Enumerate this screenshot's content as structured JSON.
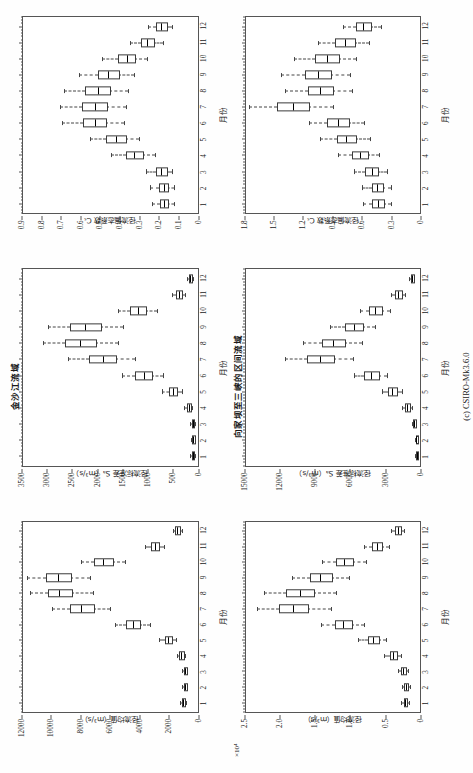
{
  "figure": {
    "caption": "(c) CSIRO-Mk3.6.0"
  },
  "panels": [
    {
      "id": "jinshajiang-runoff",
      "row_title": "",
      "y_title": "径流均值（m³/s）",
      "x_title": "月份",
      "y_multiplier": ""
    },
    {
      "id": "jinshajiang-std",
      "row_title": "金沙江流域",
      "y_title": "径流标准差 Sₐ（m³/s）",
      "x_title": "月份",
      "y_multiplier": ""
    },
    {
      "id": "jinshajiang-cv",
      "row_title": "",
      "y_title": "径流偏态系数 Cₛ",
      "x_title": "月份",
      "y_multiplier": ""
    },
    {
      "id": "xiangjiaba-runoff",
      "row_title": "",
      "y_title": "径流均值（m³/s）",
      "x_title": "月份",
      "y_multiplier": "×10⁴"
    },
    {
      "id": "xiangjiaba-std",
      "row_title": "向家坝至三峡的区间流域",
      "y_title": "径流标准差 Sₐ（m³/s）",
      "x_title": "月份",
      "y_multiplier": ""
    },
    {
      "id": "xiangjiaba-cv",
      "row_title": "",
      "y_title": "径流偏态系数 Cₛ",
      "x_title": "月份",
      "y_multiplier": ""
    }
  ],
  "chart_data": [
    {
      "type": "box",
      "id": "jinshajiang-runoff",
      "title": "金沙江流域",
      "xlabel": "月份",
      "ylabel": "径流均值（m³/s）",
      "categories": [
        1,
        2,
        3,
        4,
        5,
        6,
        7,
        8,
        9,
        10,
        11,
        12
      ],
      "xlim": [
        0.4,
        12.6
      ],
      "ylim": [
        0,
        12000
      ],
      "yticks": [
        0,
        2000,
        4000,
        6000,
        8000,
        10000,
        12000
      ],
      "ytick_labels": [
        "0",
        "2000",
        "4000",
        "6000",
        "8000",
        "10000",
        "12000"
      ],
      "grid": false,
      "boxes": [
        {
          "x": 1,
          "whisk_lo": 780,
          "q1": 900,
          "median": 980,
          "q3": 1060,
          "whisk_hi": 1180,
          "outliers": []
        },
        {
          "x": 2,
          "whisk_lo": 700,
          "q1": 800,
          "median": 870,
          "q3": 940,
          "whisk_hi": 1050,
          "outliers": []
        },
        {
          "x": 3,
          "whisk_lo": 700,
          "q1": 810,
          "median": 880,
          "q3": 960,
          "whisk_hi": 1090,
          "outliers": []
        },
        {
          "x": 4,
          "whisk_lo": 880,
          "q1": 1030,
          "median": 1140,
          "q3": 1260,
          "whisk_hi": 1440,
          "outliers": []
        },
        {
          "x": 5,
          "whisk_lo": 1500,
          "q1": 1800,
          "median": 2000,
          "q3": 2250,
          "whisk_hi": 2650,
          "outliers": []
        },
        {
          "x": 6,
          "whisk_lo": 3300,
          "q1": 4000,
          "median": 4450,
          "q3": 4950,
          "whisk_hi": 5700,
          "outliers": []
        },
        {
          "x": 7,
          "whisk_lo": 6000,
          "q1": 7200,
          "median": 8000,
          "q3": 8800,
          "whisk_hi": 10000,
          "outliers": []
        },
        {
          "x": 8,
          "whisk_lo": 7200,
          "q1": 8700,
          "median": 9500,
          "q3": 10300,
          "whisk_hi": 11500,
          "outliers": []
        },
        {
          "x": 9,
          "whisk_lo": 7400,
          "q1": 8800,
          "median": 9600,
          "q3": 10400,
          "whisk_hi": 11700,
          "outliers": []
        },
        {
          "x": 10,
          "whisk_lo": 5000,
          "q1": 5900,
          "median": 6500,
          "q3": 7100,
          "whisk_hi": 8000,
          "outliers": []
        },
        {
          "x": 11,
          "whisk_lo": 2300,
          "q1": 2700,
          "median": 2950,
          "q3": 3200,
          "whisk_hi": 3600,
          "outliers": []
        },
        {
          "x": 12,
          "whisk_lo": 1100,
          "q1": 1300,
          "median": 1400,
          "q3": 1520,
          "whisk_hi": 1700,
          "outliers": []
        }
      ]
    },
    {
      "type": "box",
      "id": "jinshajiang-std",
      "title": "",
      "xlabel": "月份",
      "ylabel": "径流标准差 Sₐ（m³/s）",
      "categories": [
        1,
        2,
        3,
        4,
        5,
        6,
        7,
        8,
        9,
        10,
        11,
        12
      ],
      "xlim": [
        0.4,
        12.6
      ],
      "ylim": [
        0,
        3500
      ],
      "yticks": [
        0,
        500,
        1000,
        1500,
        2000,
        2500,
        3000,
        3500
      ],
      "ytick_labels": [
        "0",
        "500",
        "1000",
        "1500",
        "2000",
        "2500",
        "3000",
        "3500"
      ],
      "grid": false,
      "boxes": [
        {
          "x": 1,
          "whisk_lo": 60,
          "q1": 85,
          "median": 100,
          "q3": 120,
          "whisk_hi": 150,
          "outliers": []
        },
        {
          "x": 2,
          "whisk_lo": 55,
          "q1": 75,
          "median": 90,
          "q3": 105,
          "whisk_hi": 135,
          "outliers": []
        },
        {
          "x": 3,
          "whisk_lo": 60,
          "q1": 85,
          "median": 100,
          "q3": 118,
          "whisk_hi": 150,
          "outliers": []
        },
        {
          "x": 4,
          "whisk_lo": 110,
          "q1": 150,
          "median": 180,
          "q3": 215,
          "whisk_hi": 275,
          "outliers": []
        },
        {
          "x": 5,
          "whisk_lo": 320,
          "q1": 430,
          "median": 500,
          "q3": 580,
          "whisk_hi": 720,
          "outliers": []
        },
        {
          "x": 6,
          "whisk_lo": 700,
          "q1": 930,
          "median": 1080,
          "q3": 1250,
          "whisk_hi": 1520,
          "outliers": []
        },
        {
          "x": 7,
          "whisk_lo": 1250,
          "q1": 1650,
          "median": 1900,
          "q3": 2180,
          "whisk_hi": 2600,
          "outliers": []
        },
        {
          "x": 8,
          "whisk_lo": 1600,
          "q1": 2050,
          "median": 2350,
          "q3": 2650,
          "whisk_hi": 3100,
          "outliers": []
        },
        {
          "x": 9,
          "whisk_lo": 1500,
          "q1": 1950,
          "median": 2250,
          "q3": 2550,
          "whisk_hi": 3000,
          "outliers": []
        },
        {
          "x": 10,
          "whisk_lo": 820,
          "q1": 1050,
          "median": 1200,
          "q3": 1360,
          "whisk_hi": 1600,
          "outliers": []
        },
        {
          "x": 11,
          "whisk_lo": 250,
          "q1": 330,
          "median": 380,
          "q3": 430,
          "whisk_hi": 510,
          "outliers": []
        },
        {
          "x": 12,
          "whisk_lo": 100,
          "q1": 130,
          "median": 150,
          "q3": 172,
          "whisk_hi": 205,
          "outliers": []
        }
      ]
    },
    {
      "type": "box",
      "id": "jinshajiang-cv",
      "title": "",
      "xlabel": "月份",
      "ylabel": "径流偏态系数 Cₛ",
      "categories": [
        1,
        2,
        3,
        4,
        5,
        6,
        7,
        8,
        9,
        10,
        11,
        12
      ],
      "xlim": [
        0.4,
        12.6
      ],
      "ylim": [
        0,
        0.9
      ],
      "yticks": [
        0,
        0.1,
        0.2,
        0.3,
        0.4,
        0.5,
        0.6,
        0.7,
        0.8,
        0.9
      ],
      "ytick_labels": [
        "0",
        "0.1",
        "0.2",
        "0.3",
        "0.4",
        "0.5",
        "0.6",
        "0.7",
        "0.8",
        "0.9"
      ],
      "grid": false,
      "boxes": [
        {
          "x": 1,
          "whisk_lo": 0.12,
          "q1": 0.155,
          "median": 0.175,
          "q3": 0.195,
          "whisk_hi": 0.235,
          "outliers": []
        },
        {
          "x": 2,
          "whisk_lo": 0.12,
          "q1": 0.155,
          "median": 0.175,
          "q3": 0.198,
          "whisk_hi": 0.245,
          "outliers": []
        },
        {
          "x": 3,
          "whisk_lo": 0.13,
          "q1": 0.165,
          "median": 0.19,
          "q3": 0.215,
          "whisk_hi": 0.265,
          "outliers": []
        },
        {
          "x": 4,
          "whisk_lo": 0.22,
          "q1": 0.285,
          "median": 0.325,
          "q3": 0.37,
          "whisk_hi": 0.445,
          "outliers": []
        },
        {
          "x": 5,
          "whisk_lo": 0.3,
          "q1": 0.375,
          "median": 0.42,
          "q3": 0.47,
          "whisk_hi": 0.555,
          "outliers": []
        },
        {
          "x": 6,
          "whisk_lo": 0.38,
          "q1": 0.475,
          "median": 0.53,
          "q3": 0.59,
          "whisk_hi": 0.7,
          "outliers": []
        },
        {
          "x": 7,
          "whisk_lo": 0.37,
          "q1": 0.47,
          "median": 0.53,
          "q3": 0.595,
          "whisk_hi": 0.71,
          "outliers": []
        },
        {
          "x": 8,
          "whisk_lo": 0.36,
          "q1": 0.455,
          "median": 0.515,
          "q3": 0.58,
          "whisk_hi": 0.69,
          "outliers": []
        },
        {
          "x": 9,
          "whisk_lo": 0.33,
          "q1": 0.41,
          "median": 0.46,
          "q3": 0.515,
          "whisk_hi": 0.61,
          "outliers": []
        },
        {
          "x": 10,
          "whisk_lo": 0.26,
          "q1": 0.325,
          "median": 0.365,
          "q3": 0.41,
          "whisk_hi": 0.49,
          "outliers": []
        },
        {
          "x": 11,
          "whisk_lo": 0.18,
          "q1": 0.23,
          "median": 0.26,
          "q3": 0.292,
          "whisk_hi": 0.35,
          "outliers": []
        },
        {
          "x": 12,
          "whisk_lo": 0.13,
          "q1": 0.165,
          "median": 0.188,
          "q3": 0.212,
          "whisk_hi": 0.255,
          "outliers": []
        }
      ]
    },
    {
      "type": "box",
      "id": "xiangjiaba-runoff",
      "title": "向家坝至三峡的区间流域",
      "xlabel": "月份",
      "ylabel": "径流均值（m³/s）",
      "y_multiplier": "×10⁴",
      "categories": [
        1,
        2,
        3,
        4,
        5,
        6,
        7,
        8,
        9,
        10,
        11,
        12
      ],
      "xlim": [
        0.4,
        12.6
      ],
      "ylim": [
        0,
        2.5
      ],
      "yticks": [
        0,
        0.5,
        1.0,
        1.5,
        2.0,
        2.5
      ],
      "ytick_labels": [
        "0",
        "0.5",
        "1.0",
        "1.5",
        "2.0",
        "2.5"
      ],
      "grid": false,
      "boxes": [
        {
          "x": 1,
          "whisk_lo": 0.16,
          "q1": 0.195,
          "median": 0.215,
          "q3": 0.235,
          "whisk_hi": 0.275,
          "outliers": []
        },
        {
          "x": 2,
          "whisk_lo": 0.15,
          "q1": 0.185,
          "median": 0.205,
          "q3": 0.225,
          "whisk_hi": 0.265,
          "outliers": []
        },
        {
          "x": 3,
          "whisk_lo": 0.17,
          "q1": 0.215,
          "median": 0.24,
          "q3": 0.268,
          "whisk_hi": 0.32,
          "outliers": []
        },
        {
          "x": 4,
          "whisk_lo": 0.27,
          "q1": 0.34,
          "median": 0.385,
          "q3": 0.435,
          "whisk_hi": 0.52,
          "outliers": []
        },
        {
          "x": 5,
          "whisk_lo": 0.48,
          "q1": 0.595,
          "median": 0.67,
          "q3": 0.75,
          "whisk_hi": 0.89,
          "outliers": []
        },
        {
          "x": 6,
          "whisk_lo": 0.8,
          "q1": 0.985,
          "median": 1.1,
          "q3": 1.22,
          "whisk_hi": 1.42,
          "outliers": []
        },
        {
          "x": 7,
          "whisk_lo": 1.28,
          "q1": 1.62,
          "median": 1.82,
          "q3": 2.02,
          "whisk_hi": 2.34,
          "outliers": []
        },
        {
          "x": 8,
          "whisk_lo": 1.2,
          "q1": 1.53,
          "median": 1.72,
          "q3": 1.92,
          "whisk_hi": 2.24,
          "outliers": []
        },
        {
          "x": 9,
          "whisk_lo": 1.02,
          "q1": 1.28,
          "median": 1.43,
          "q3": 1.58,
          "whisk_hi": 1.84,
          "outliers": []
        },
        {
          "x": 10,
          "whisk_lo": 0.78,
          "q1": 0.975,
          "median": 1.09,
          "q3": 1.2,
          "whisk_hi": 1.4,
          "outliers": []
        },
        {
          "x": 11,
          "whisk_lo": 0.45,
          "q1": 0.555,
          "median": 0.62,
          "q3": 0.688,
          "whisk_hi": 0.8,
          "outliers": []
        },
        {
          "x": 12,
          "whisk_lo": 0.23,
          "q1": 0.285,
          "median": 0.318,
          "q3": 0.352,
          "whisk_hi": 0.41,
          "outliers": []
        }
      ]
    },
    {
      "type": "box",
      "id": "xiangjiaba-std",
      "title": "",
      "xlabel": "月份",
      "ylabel": "径流标准差 Sₐ（m³/s）",
      "categories": [
        1,
        2,
        3,
        4,
        5,
        6,
        7,
        8,
        9,
        10,
        11,
        12
      ],
      "xlim": [
        0.4,
        12.6
      ],
      "ylim": [
        0,
        15000
      ],
      "yticks": [
        0,
        3000,
        6000,
        9000,
        12000,
        15000
      ],
      "ytick_labels": [
        "0",
        "3000",
        "6000",
        "9000",
        "12000",
        "15000"
      ],
      "grid": false,
      "boxes": [
        {
          "x": 1,
          "whisk_lo": 190,
          "q1": 250,
          "median": 290,
          "q3": 330,
          "whisk_hi": 400,
          "outliers": []
        },
        {
          "x": 2,
          "whisk_lo": 200,
          "q1": 265,
          "median": 305,
          "q3": 350,
          "whisk_hi": 420,
          "outliers": []
        },
        {
          "x": 3,
          "whisk_lo": 330,
          "q1": 440,
          "median": 510,
          "q3": 585,
          "whisk_hi": 710,
          "outliers": []
        },
        {
          "x": 4,
          "whisk_lo": 720,
          "q1": 960,
          "median": 1110,
          "q3": 1280,
          "whisk_hi": 1560,
          "outliers": []
        },
        {
          "x": 5,
          "whisk_lo": 1550,
          "q1": 2050,
          "median": 2380,
          "q3": 2720,
          "whisk_hi": 3280,
          "outliers": []
        },
        {
          "x": 6,
          "whisk_lo": 2800,
          "q1": 3650,
          "median": 4200,
          "q3": 4780,
          "whisk_hi": 5700,
          "outliers": []
        },
        {
          "x": 7,
          "whisk_lo": 5800,
          "q1": 7500,
          "median": 8600,
          "q3": 9750,
          "whisk_hi": 11600,
          "outliers": []
        },
        {
          "x": 8,
          "whisk_lo": 5000,
          "q1": 6500,
          "median": 7450,
          "q3": 8450,
          "whisk_hi": 10100,
          "outliers": []
        },
        {
          "x": 9,
          "whisk_lo": 3900,
          "q1": 5000,
          "median": 5700,
          "q3": 6450,
          "whisk_hi": 7700,
          "outliers": []
        },
        {
          "x": 10,
          "whisk_lo": 2600,
          "q1": 3350,
          "median": 3850,
          "q3": 4350,
          "whisk_hi": 5200,
          "outliers": []
        },
        {
          "x": 11,
          "whisk_lo": 1250,
          "q1": 1620,
          "median": 1860,
          "q3": 2110,
          "whisk_hi": 2520,
          "outliers": []
        },
        {
          "x": 12,
          "whisk_lo": 480,
          "q1": 620,
          "median": 715,
          "q3": 810,
          "whisk_hi": 970,
          "outliers": []
        }
      ]
    },
    {
      "type": "box",
      "id": "xiangjiaba-cv",
      "title": "",
      "xlabel": "月份",
      "ylabel": "径流偏态系数 Cₛ",
      "categories": [
        1,
        2,
        3,
        4,
        5,
        6,
        7,
        8,
        9,
        10,
        11,
        12
      ],
      "xlim": [
        0.4,
        12.6
      ],
      "ylim": [
        0,
        1.8
      ],
      "yticks": [
        0,
        0.3,
        0.6,
        0.9,
        1.2,
        1.5,
        1.8
      ],
      "ytick_labels": [
        "0",
        "0.3",
        "0.6",
        "0.9",
        "1.2",
        "1.5",
        "1.8"
      ],
      "grid": false,
      "boxes": [
        {
          "x": 1,
          "whisk_lo": 0.3,
          "q1": 0.385,
          "median": 0.435,
          "q3": 0.49,
          "whisk_hi": 0.59,
          "outliers": []
        },
        {
          "x": 2,
          "whisk_lo": 0.3,
          "q1": 0.39,
          "median": 0.44,
          "q3": 0.495,
          "whisk_hi": 0.595,
          "outliers": []
        },
        {
          "x": 3,
          "whisk_lo": 0.34,
          "q1": 0.44,
          "median": 0.5,
          "q3": 0.565,
          "whisk_hi": 0.68,
          "outliers": []
        },
        {
          "x": 4,
          "whisk_lo": 0.42,
          "q1": 0.545,
          "median": 0.62,
          "q3": 0.7,
          "whisk_hi": 0.845,
          "outliers": []
        },
        {
          "x": 5,
          "whisk_lo": 0.52,
          "q1": 0.67,
          "median": 0.76,
          "q3": 0.86,
          "whisk_hi": 1.035,
          "outliers": []
        },
        {
          "x": 6,
          "whisk_lo": 0.58,
          "q1": 0.745,
          "median": 0.845,
          "q3": 0.955,
          "whisk_hi": 1.15,
          "outliers": []
        },
        {
          "x": 7,
          "whisk_lo": 0.9,
          "q1": 1.16,
          "median": 1.31,
          "q3": 1.47,
          "whisk_hi": 1.76,
          "outliers": []
        },
        {
          "x": 8,
          "whisk_lo": 0.7,
          "q1": 0.905,
          "median": 1.03,
          "q3": 1.16,
          "whisk_hi": 1.39,
          "outliers": []
        },
        {
          "x": 9,
          "whisk_lo": 0.72,
          "q1": 0.93,
          "median": 1.055,
          "q3": 1.19,
          "whisk_hi": 1.43,
          "outliers": []
        },
        {
          "x": 10,
          "whisk_lo": 0.66,
          "q1": 0.845,
          "median": 0.96,
          "q3": 1.08,
          "whisk_hi": 1.295,
          "outliers": []
        },
        {
          "x": 11,
          "whisk_lo": 0.53,
          "q1": 0.68,
          "median": 0.775,
          "q3": 0.875,
          "whisk_hi": 1.05,
          "outliers": []
        },
        {
          "x": 12,
          "whisk_lo": 0.4,
          "q1": 0.515,
          "median": 0.585,
          "q3": 0.66,
          "whisk_hi": 0.795,
          "outliers": []
        }
      ]
    }
  ]
}
